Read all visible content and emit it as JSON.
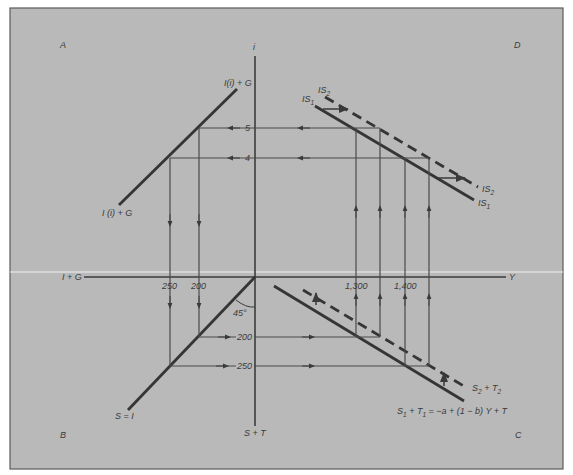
{
  "diagram": {
    "type": "four-quadrant IS derivation diagram",
    "colors": {
      "background": "#b9b9b9",
      "frame": "#5a5a5a",
      "line": "#353535",
      "text": "#3a3a3a"
    },
    "quadrants": {
      "top_left": "A",
      "top_right": "D",
      "bottom_left": "B",
      "bottom_right": "C"
    },
    "axes": {
      "vertical_top": "i",
      "vertical_bottom": "S + T",
      "horizontal_left": "I + G",
      "horizontal_right": "Y"
    },
    "ticks": {
      "i_values": [
        "5",
        "4"
      ],
      "IG_values": [
        "250",
        "200"
      ],
      "ST_values": [
        "200",
        "250"
      ],
      "Y_values": [
        "1,300",
        "1,400"
      ]
    },
    "curves": {
      "investment_upper": "I(i) + G",
      "investment_lower": "I (i) + G",
      "savings_identity": "S = I",
      "angle": "45°",
      "is1": {
        "main": "IS",
        "sub": "1"
      },
      "is2": {
        "main": "IS",
        "sub": "2"
      },
      "st2": {
        "main1": "S",
        "sub1": "2",
        "mid": " + T",
        "sub2": "2"
      },
      "st1": {
        "main1": "S",
        "sub1": "1",
        "mid": " + T",
        "sub2": "1",
        "rest": " = −a + (1 − b) Y + T"
      }
    }
  }
}
